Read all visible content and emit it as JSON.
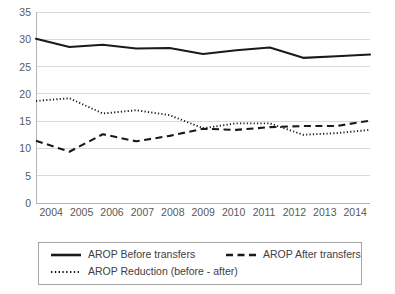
{
  "chart_data": {
    "type": "line",
    "title": "",
    "xlabel": "",
    "ylabel": "",
    "x": [
      2004,
      2005,
      2006,
      2007,
      2008,
      2009,
      2010,
      2011,
      2012,
      2013,
      2014
    ],
    "categories": [
      "2004",
      "2005",
      "2006",
      "2007",
      "2008",
      "2009",
      "2010",
      "2011",
      "2012",
      "2013",
      "2014"
    ],
    "xlim": [
      2004,
      2014
    ],
    "ylim": [
      0,
      35
    ],
    "y_ticks": [
      0,
      5,
      10,
      15,
      20,
      25,
      30,
      35
    ],
    "y_tick_labels": [
      "0",
      "5",
      "10",
      "15",
      "20",
      "25",
      "30",
      "35"
    ],
    "grid": true,
    "grid_axis": "y",
    "legend_position": "bottom",
    "series": [
      {
        "name": "AROP Before transfers",
        "style": "solid",
        "color": "#1a1a1a",
        "values": [
          30.1,
          28.6,
          29.0,
          28.3,
          28.4,
          27.3,
          28.0,
          28.5,
          26.6,
          26.9,
          27.2
        ]
      },
      {
        "name": "AROP After transfers",
        "style": "dashed",
        "color": "#1a1a1a",
        "values": [
          11.4,
          9.4,
          12.6,
          11.3,
          12.3,
          13.6,
          13.4,
          13.9,
          14.1,
          14.1,
          15.1
        ]
      },
      {
        "name": "AROP Reduction (before - after)",
        "style": "dotted",
        "color": "#1a1a1a",
        "values": [
          18.7,
          19.2,
          16.4,
          17.0,
          16.1,
          13.7,
          14.6,
          14.6,
          12.5,
          12.8,
          13.4
        ]
      }
    ]
  },
  "legend": {
    "items": [
      {
        "label": "AROP Before transfers",
        "style": "solid"
      },
      {
        "label": "AROP After transfers",
        "style": "dashed"
      },
      {
        "label": "AROP Reduction (before - after)",
        "style": "dotted"
      }
    ]
  },
  "axis": {
    "y_labels": [
      "35",
      "30",
      "25",
      "20",
      "15",
      "10",
      "5",
      "0"
    ],
    "x_labels": [
      "2004",
      "2005",
      "2006",
      "2007",
      "2008",
      "2009",
      "2010",
      "2011",
      "2012",
      "2013",
      "2014"
    ]
  }
}
